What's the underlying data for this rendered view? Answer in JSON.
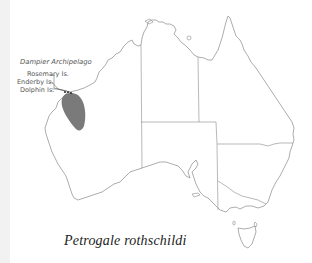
{
  "map": {
    "title": "Petrogale rothschildi",
    "region": "Australia",
    "labels": {
      "archipelago": "Dampier Archipelago",
      "islands": [
        "Rosemary Is.",
        "Enderby Is.",
        "Dolphin Is."
      ]
    },
    "colors": {
      "outline": "#8a8a8a",
      "range_fill": "#7a7a7a",
      "background": "#ffffff",
      "left_strip": "#f2f2f2"
    },
    "range": {
      "description": "distribution range, Pilbara region of Western Australia"
    }
  }
}
